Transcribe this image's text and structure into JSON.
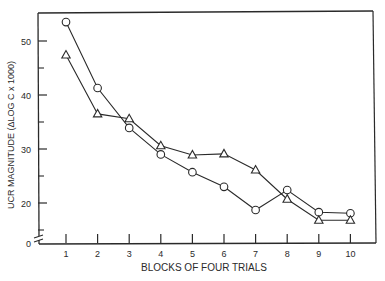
{
  "chart_data": {
    "type": "line",
    "title": "",
    "xlabel": "BLOCKS OF FOUR TRIALS",
    "ylabel": "UCR MAGNITUDE (ΔLOG C x 1000)",
    "x": [
      1,
      2,
      3,
      4,
      5,
      6,
      7,
      8,
      9,
      10
    ],
    "x_tick_labels": [
      "1",
      "2",
      "3",
      "4",
      "5",
      "6",
      "7",
      "8",
      "9",
      "10"
    ],
    "y_tick_labels": [
      "0",
      "20",
      "30",
      "40",
      "50"
    ],
    "y_major_ticks": [
      20,
      30,
      40,
      50
    ],
    "y_minor_ticks": [
      15,
      25,
      35,
      45
    ],
    "axis_break": true,
    "ylim": [
      0,
      55
    ],
    "xlim": [
      0.2,
      10.8
    ],
    "grid": false,
    "legend": null,
    "series": [
      {
        "name": "circles",
        "marker": "circle",
        "values": [
          53.5,
          41.3,
          33.9,
          29.0,
          25.7,
          23.0,
          18.7,
          22.4,
          18.3,
          18.1
        ]
      },
      {
        "name": "triangles",
        "marker": "triangle",
        "values": [
          47.4,
          36.5,
          35.6,
          30.6,
          28.9,
          29.1,
          26.1,
          20.7,
          16.8,
          16.8
        ]
      }
    ]
  },
  "axes": {
    "xlabel": "BLOCKS OF FOUR TRIALS",
    "ylabel": "UCR MAGNITUDE (ΔLOG C x 1000)"
  },
  "colors": {
    "ink": "#2a2a2a",
    "background": "#ffffff"
  }
}
